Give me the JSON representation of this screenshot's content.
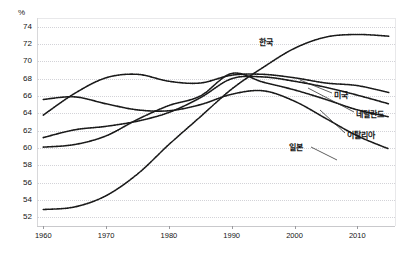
{
  "chart_data": {
    "type": "line",
    "title": "",
    "subtitle": "",
    "xlabel": "",
    "ylabel": "%",
    "ylim": [
      51,
      75
    ],
    "xlim": [
      1959,
      2016
    ],
    "grid": true,
    "legend_position": "inline-right-end-labels",
    "yticks": [
      52,
      54,
      56,
      58,
      60,
      62,
      64,
      66,
      68,
      70,
      72,
      74
    ],
    "xticks": [
      1960,
      1970,
      1980,
      1990,
      2000,
      2010
    ],
    "annotations": [
      "한국",
      "미국",
      "네덜란드",
      "이탈리아",
      "일본"
    ],
    "series": [
      {
        "name": "한국",
        "label": "한국",
        "color": "#1a1a1a",
        "style": "dotted",
        "x": [
          1960,
          1965,
          1970,
          1975,
          1980,
          1985,
          1990,
          1995,
          2000,
          2005,
          2010,
          2015
        ],
        "values": [
          52.9,
          53.2,
          54.5,
          57.0,
          60.4,
          63.6,
          66.8,
          69.3,
          71.5,
          72.8,
          73.1,
          72.9
        ]
      },
      {
        "name": "미국",
        "label": "미국",
        "color": "#1a1a1a",
        "style": "dotted",
        "x": [
          1960,
          1965,
          1970,
          1975,
          1980,
          1985,
          1990,
          1995,
          2000,
          2005,
          2010,
          2015
        ],
        "values": [
          63.8,
          66.3,
          68.1,
          68.5,
          67.7,
          67.5,
          68.4,
          68.5,
          68.1,
          67.5,
          67.2,
          66.4
        ]
      },
      {
        "name": "네덜란드",
        "label": "네덜란드",
        "color": "#1a1a1a",
        "style": "dotted",
        "x": [
          1960,
          1965,
          1970,
          1975,
          1980,
          1985,
          1990,
          1995,
          2000,
          2005,
          2010,
          2015
        ],
        "values": [
          61.2,
          62.1,
          62.5,
          63.1,
          64.1,
          65.8,
          68.0,
          68.2,
          67.7,
          67.0,
          66.1,
          65.1
        ]
      },
      {
        "name": "이탈리아",
        "label": "이탈리아",
        "color": "#1a1a1a",
        "style": "dotted",
        "x": [
          1960,
          1965,
          1970,
          1975,
          1980,
          1985,
          1990,
          1995,
          2000,
          2005,
          2010,
          2015
        ],
        "values": [
          60.1,
          60.4,
          61.4,
          63.3,
          64.9,
          66.0,
          68.6,
          67.6,
          66.7,
          65.6,
          64.4,
          63.6
        ]
      },
      {
        "name": "일본",
        "label": "일본",
        "color": "#1a1a1a",
        "style": "dotted",
        "x": [
          1960,
          1965,
          1970,
          1975,
          1980,
          1985,
          1990,
          1995,
          2000,
          2005,
          2010,
          2015
        ],
        "values": [
          65.6,
          65.9,
          65.1,
          64.4,
          64.3,
          65.0,
          66.2,
          66.6,
          65.4,
          63.4,
          61.4,
          59.9
        ]
      }
    ]
  },
  "axis": {
    "y_unit": "%",
    "y_tick_labels": [
      "74",
      "72",
      "70",
      "68",
      "66",
      "64",
      "62",
      "60",
      "58",
      "56",
      "54",
      "52"
    ],
    "x_tick_labels": [
      "1960",
      "1970",
      "1980",
      "1990",
      "2000",
      "2010"
    ]
  },
  "labels": {
    "korea": "한국",
    "usa": "미국",
    "netherlands": "네덜란드",
    "italy": "이탈리아",
    "japan": "일본"
  }
}
